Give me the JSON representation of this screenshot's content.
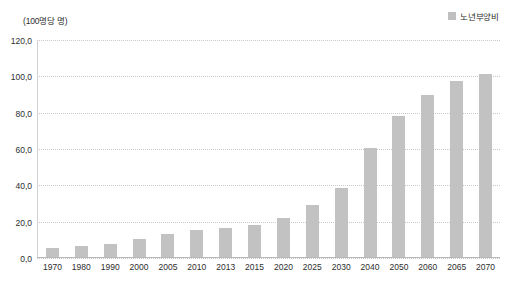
{
  "unit_label": "(100명당 명)",
  "legend": {
    "label": "노년부양비",
    "swatch_color": "#bfbfbf",
    "swatch_icon": "square-swatch-icon"
  },
  "yticks": [
    "0,0",
    "20,0",
    "40,0",
    "60,0",
    "80,0",
    "100,0",
    "120,0"
  ],
  "chart_data": {
    "type": "bar",
    "title": "",
    "subtitle": "",
    "xlabel": "",
    "ylabel": "(100명당 명)",
    "ylim": [
      0,
      120
    ],
    "ytick_values": [
      0,
      20,
      40,
      60,
      80,
      100,
      120
    ],
    "ytick_labels": [
      "0,0",
      "20,0",
      "40,0",
      "60,0",
      "80,0",
      "100,0",
      "120,0"
    ],
    "grid": "horizontal-dotted",
    "legend_position": "top-right",
    "legend_entries": [
      "노년부양비"
    ],
    "categories": [
      "1970",
      "1980",
      "1990",
      "2000",
      "2005",
      "2010",
      "2013",
      "2015",
      "2020",
      "2025",
      "2030",
      "2040",
      "2050",
      "2060",
      "2065",
      "2070"
    ],
    "series": [
      {
        "name": "노년부양비",
        "color": "#c2c2c2",
        "values": [
          5.0,
          6.1,
          7.4,
          10.1,
          12.6,
          14.8,
          16.1,
          17.5,
          21.4,
          28.5,
          38.2,
          59.8,
          77.6,
          89.4,
          97.1,
          100.6
        ]
      }
    ]
  }
}
